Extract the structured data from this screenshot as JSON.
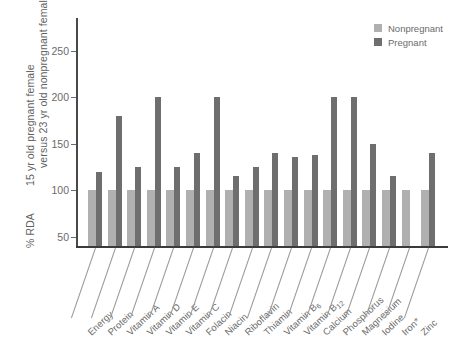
{
  "chart_data": {
    "type": "bar",
    "title": "",
    "xlabel": "",
    "ylabel": "% RDA",
    "ylabel_full_line1": "15 yr old pregnant female",
    "ylabel_full_line2": "versus 23 yr old nonpregnant female",
    "ylim": [
      40,
      285
    ],
    "yticks": [
      50,
      100,
      150,
      200,
      250
    ],
    "ytick_labels": [
      "50",
      "100",
      "150",
      "200",
      "250"
    ],
    "grid": false,
    "legend_position": "top-right",
    "categories": [
      "Energy",
      "Protein",
      "Vitamin A",
      "Vitamin D",
      "Vitamin E",
      "Vitamin C",
      "Folacin",
      "Niacin",
      "Riboflavin",
      "Thiamin",
      "Vitamin B6",
      "Vitamin B12",
      "Calcium",
      "Phosphorus",
      "Magnesium",
      "Iodine",
      "Iron*",
      "Zinc"
    ],
    "categories_display": [
      {
        "base": "Energy",
        "sub": ""
      },
      {
        "base": "Protein",
        "sub": ""
      },
      {
        "base": "Vitamin A",
        "sub": ""
      },
      {
        "base": "Vitamin D",
        "sub": ""
      },
      {
        "base": "Vitamin E",
        "sub": ""
      },
      {
        "base": "Vitamin C",
        "sub": ""
      },
      {
        "base": "Folacin",
        "sub": ""
      },
      {
        "base": "Niacin",
        "sub": ""
      },
      {
        "base": "Riboflavin",
        "sub": ""
      },
      {
        "base": "Thiamin",
        "sub": ""
      },
      {
        "base": "Vitamin B",
        "sub": "6"
      },
      {
        "base": "Vitamin B",
        "sub": "12"
      },
      {
        "base": "Calcium",
        "sub": ""
      },
      {
        "base": "Phosphorus",
        "sub": ""
      },
      {
        "base": "Magnesium",
        "sub": ""
      },
      {
        "base": "Iodine",
        "sub": ""
      },
      {
        "base": "Iron*",
        "sub": ""
      },
      {
        "base": "Zinc",
        "sub": ""
      }
    ],
    "series": [
      {
        "name": "Nonpregnant",
        "color": "#b0b0b0",
        "values": [
          100,
          100,
          100,
          100,
          100,
          100,
          100,
          100,
          100,
          100,
          100,
          100,
          100,
          100,
          100,
          100,
          100,
          100
        ]
      },
      {
        "name": "Pregnant",
        "color": "#6e6e6e",
        "values": [
          120,
          180,
          125,
          200,
          125,
          140,
          200,
          115,
          125,
          140,
          136,
          138,
          200,
          200,
          150,
          115,
          null,
          140
        ]
      }
    ]
  },
  "legend": {
    "items": [
      {
        "label": "Nonpregnant",
        "color": "#b0b0b0"
      },
      {
        "label": "Pregnant",
        "color": "#6e6e6e"
      }
    ]
  },
  "axis": {
    "y_title_line1": "15 yr old pregnant female",
    "y_title_line2": "versus 23 yr old nonpregnant female",
    "y_unit_label": "% RDA"
  }
}
